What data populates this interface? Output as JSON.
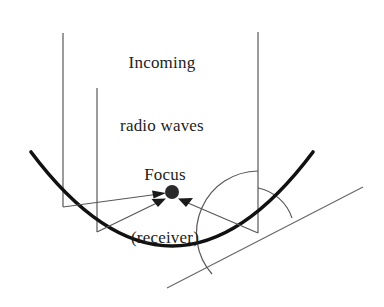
{
  "figure": {
    "background_color": "#ffffff",
    "labels": {
      "incoming": {
        "line1": "Incoming",
        "line2": "radio waves"
      },
      "focus": {
        "line1": "Focus",
        "line2": "(receiver)"
      }
    },
    "colors": {
      "dish_stroke": "#111111",
      "ray_stroke": "#555555",
      "tangent_stroke": "#666666",
      "arc_stroke": "#555555",
      "focus_dot": "#2b2b2b",
      "text": "#1d1d1d"
    },
    "geometry": {
      "focus_point": {
        "x": 172,
        "y": 192
      },
      "focus_dot_radius": 7,
      "dish": {
        "type": "parabola",
        "left_end": {
          "x": 31,
          "y": 152
        },
        "vertex": {
          "x": 172,
          "y": 246
        },
        "right_end": {
          "x": 313,
          "y": 152
        },
        "stroke_width": 3.6
      },
      "incoming_rays": [
        {
          "name": "ray-left-outer",
          "x": 63,
          "top_y": 33,
          "hit_y": 207
        },
        {
          "name": "ray-left-inner",
          "x": 97,
          "top_y": 88,
          "hit_y": 232
        },
        {
          "name": "ray-right",
          "x": 258,
          "top_y": 32,
          "hit_y": 233
        }
      ],
      "reflected_rays": [
        {
          "name": "reflected-from-left-outer",
          "from": {
            "x": 63,
            "y": 207
          },
          "to": {
            "x": 172,
            "y": 192
          }
        },
        {
          "name": "reflected-from-left-inner",
          "from": {
            "x": 97,
            "y": 232
          },
          "to": {
            "x": 172,
            "y": 192
          }
        },
        {
          "name": "reflected-from-right",
          "from": {
            "x": 258,
            "y": 233
          },
          "to": {
            "x": 172,
            "y": 192
          }
        }
      ],
      "tangent_line": {
        "start": {
          "x": 167,
          "y": 288
        },
        "end": {
          "x": 363,
          "y": 187
        }
      },
      "angle_arcs": [
        {
          "name": "angle-incidence-arc",
          "center": {
            "x": 258,
            "y": 233
          },
          "radius": 45
        },
        {
          "name": "angle-reflection-arc",
          "center": {
            "x": 258,
            "y": 233
          },
          "radius": 62
        }
      ]
    }
  }
}
